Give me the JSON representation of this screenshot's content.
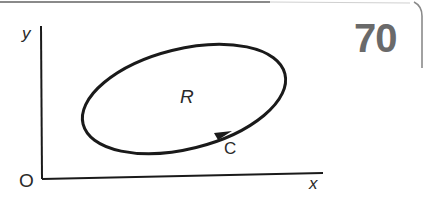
{
  "figure": {
    "page_number": "70",
    "axes": {
      "y_label": "y",
      "x_label": "x",
      "origin_label": "O"
    },
    "region": {
      "label": "R"
    },
    "curve": {
      "label": "C",
      "orientation": "counterclockwise",
      "arrow": "on lower-right of ellipse"
    },
    "colors": {
      "stroke": "#1a1a1a",
      "page_number": "#6a6a6a",
      "frame": "#9a9a9a"
    }
  }
}
